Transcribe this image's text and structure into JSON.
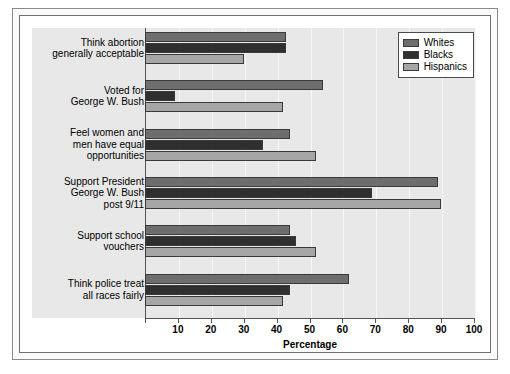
{
  "chart_data": {
    "type": "bar",
    "orientation": "horizontal",
    "title": "",
    "xlabel": "Percentage",
    "ylabel": "",
    "xlim": [
      0,
      100
    ],
    "xticks": [
      0,
      10,
      20,
      30,
      40,
      50,
      60,
      70,
      80,
      90,
      100
    ],
    "xtick_labels": [
      "",
      "10",
      "20",
      "30",
      "40",
      "50",
      "60",
      "70",
      "80",
      "90",
      "100"
    ],
    "grid": true,
    "legend_position": "top-right",
    "categories": [
      "Think abortion generally acceptable",
      "Voted for George W. Bush",
      "Feel women and men have equal opportunities",
      "Support President George W. Bush post 9/11",
      "Support school vouchers",
      "Think police treat all races fairly"
    ],
    "category_lines": [
      [
        "Think abortion",
        "generally acceptable"
      ],
      [
        "Voted for",
        "George W. Bush"
      ],
      [
        "Feel women and",
        "men have equal",
        "opportunities"
      ],
      [
        "Support President",
        "George W. Bush",
        "post 9/11"
      ],
      [
        "Support school",
        "vouchers"
      ],
      [
        "Think police treat",
        "all races fairly"
      ]
    ],
    "series": [
      {
        "name": "Whites",
        "color": "#6e6e6e",
        "values": [
          43,
          54,
          44,
          89,
          44,
          62
        ]
      },
      {
        "name": "Blacks",
        "color": "#2f2f2f",
        "values": [
          43,
          9,
          36,
          69,
          46,
          44
        ]
      },
      {
        "name": "Hispanics",
        "color": "#a6a6a6",
        "values": [
          30,
          42,
          52,
          90,
          52,
          42
        ]
      }
    ]
  },
  "legend": {
    "items": [
      {
        "label": "Whites",
        "color": "#6e6e6e"
      },
      {
        "label": "Blacks",
        "color": "#2f2f2f"
      },
      {
        "label": "Hispanics",
        "color": "#a6a6a6"
      }
    ]
  }
}
